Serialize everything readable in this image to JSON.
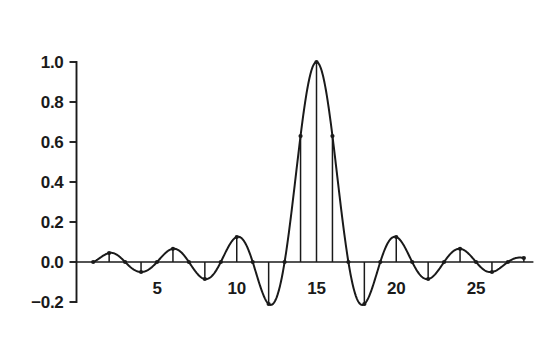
{
  "chart_data": {
    "type": "line",
    "title": "",
    "subtitle": "",
    "xlabel": "",
    "ylabel": "",
    "xlim": [
      0.2,
      28.6
    ],
    "ylim": [
      -0.24,
      1.04
    ],
    "grid": false,
    "legend": null,
    "x_ticks": [
      5,
      10,
      15,
      20,
      25
    ],
    "x_tick_labels": [
      "5",
      "10",
      "15",
      "20",
      "25"
    ],
    "y_ticks": [
      -0.2,
      0.0,
      0.2,
      0.4,
      0.6,
      0.8,
      1.0
    ],
    "y_tick_labels": [
      "−0.2",
      "0.0",
      "0.2",
      "0.4",
      "0.6",
      "0.8",
      "1.0"
    ],
    "marker": "dot",
    "stems": true,
    "series": [
      {
        "name": "sinc",
        "x": [
          1,
          2,
          3,
          4,
          5,
          6,
          7,
          8,
          9,
          10,
          11,
          12,
          13,
          14,
          15,
          16,
          17,
          18,
          19,
          20,
          21,
          22,
          23,
          24,
          25,
          26,
          27,
          28
        ],
        "values": [
          0.0,
          0.045,
          0.0,
          -0.05,
          0.0,
          0.066,
          0.0,
          -0.085,
          0.0,
          0.125,
          0.0,
          -0.21,
          0.0,
          0.63,
          1.0,
          0.63,
          0.0,
          -0.21,
          0.0,
          0.125,
          0.0,
          -0.085,
          0.0,
          0.066,
          0.0,
          -0.05,
          0.0,
          0.02
        ]
      }
    ],
    "curve_note": "continuous sinc envelope through sample points, center x=15"
  },
  "axes": {
    "y_axis_name": "value-axis",
    "x_axis_name": "sample-index-axis"
  }
}
